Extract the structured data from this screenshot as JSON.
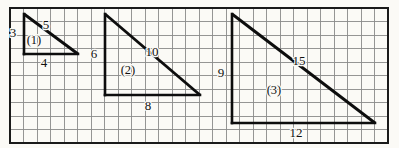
{
  "figure": {
    "background_color": "#fbfaf6",
    "grid_line_color": "#8a8a8a",
    "border_color": "#1a1a1a",
    "triangle_stroke_color": "#0d0d0d",
    "grid": {
      "cell_size_px": 13.5,
      "columns": 28,
      "rows": 10,
      "left_px": 10,
      "top_px": 8,
      "right_px": 388,
      "bottom_px": 143
    },
    "triangles": [
      {
        "index_label": "(1)",
        "vertical_leg_label": "3",
        "horizontal_leg_label": "4",
        "hypotenuse_label": "5",
        "apex": {
          "x": 24,
          "y": 14
        },
        "right_angle": {
          "x": 24,
          "y": 54
        },
        "base_end": {
          "x": 78,
          "y": 54
        },
        "index_pos": {
          "x": 34,
          "y": 44
        },
        "vertical_label_pos": {
          "x": 13,
          "y": 37
        },
        "horizontal_label_pos": {
          "x": 44,
          "y": 67
        },
        "hypotenuse_label_pos": {
          "x": 46,
          "y": 29
        }
      },
      {
        "index_label": "(2)",
        "vertical_leg_label": "6",
        "horizontal_leg_label": "8",
        "hypotenuse_label": "10",
        "apex": {
          "x": 105,
          "y": 14
        },
        "right_angle": {
          "x": 105,
          "y": 95
        },
        "base_end": {
          "x": 200,
          "y": 95
        },
        "index_pos": {
          "x": 128,
          "y": 74
        },
        "vertical_label_pos": {
          "x": 94,
          "y": 58
        },
        "horizontal_label_pos": {
          "x": 148,
          "y": 110
        },
        "hypotenuse_label_pos": {
          "x": 152,
          "y": 56
        }
      },
      {
        "index_label": "(3)",
        "vertical_leg_label": "9",
        "horizontal_leg_label": "12",
        "hypotenuse_label": "15",
        "apex": {
          "x": 232,
          "y": 14
        },
        "right_angle": {
          "x": 232,
          "y": 123
        },
        "base_end": {
          "x": 375,
          "y": 123
        },
        "index_pos": {
          "x": 274,
          "y": 94
        },
        "vertical_label_pos": {
          "x": 221,
          "y": 77
        },
        "horizontal_label_pos": {
          "x": 296,
          "y": 137
        },
        "hypotenuse_label_pos": {
          "x": 299,
          "y": 65
        }
      }
    ]
  },
  "chart_data": {
    "type": "diagram",
    "xlabel": "",
    "ylabel": "",
    "grid": true,
    "legend": "none",
    "series": [
      {
        "name": "(1)",
        "legs": [
          3,
          4
        ],
        "hypotenuse": 5,
        "labels": [
          "3",
          "4",
          "5",
          "(1)"
        ]
      },
      {
        "name": "(2)",
        "legs": [
          6,
          8
        ],
        "hypotenuse": 10,
        "labels": [
          "6",
          "8",
          "10",
          "(2)"
        ]
      },
      {
        "name": "(3)",
        "legs": [
          9,
          12
        ],
        "hypotenuse": 15,
        "labels": [
          "9",
          "12",
          "15",
          "(3)"
        ]
      }
    ]
  }
}
